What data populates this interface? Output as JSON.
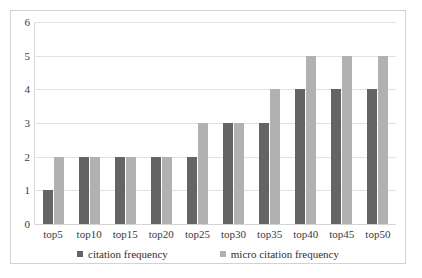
{
  "chart_data": {
    "type": "bar",
    "title": "",
    "xlabel": "",
    "ylabel": "",
    "categories": [
      "top5",
      "top10",
      "top15",
      "top20",
      "top25",
      "top30",
      "top35",
      "top40",
      "top45",
      "top50"
    ],
    "series": [
      {
        "name": "citation frequency",
        "color": "#646464",
        "values": [
          1,
          2,
          2,
          2,
          2,
          3,
          3,
          4,
          4,
          4
        ]
      },
      {
        "name": "micro citation frequency",
        "color": "#b1b1b1",
        "values": [
          2,
          2,
          2,
          2,
          3,
          3,
          4,
          5,
          5,
          5
        ]
      }
    ],
    "ylim": [
      0,
      6
    ],
    "yticks": [
      0,
      1,
      2,
      3,
      4,
      5,
      6
    ],
    "ytick_labels": [
      "0",
      "1",
      "2",
      "3",
      "4",
      "5",
      "6"
    ],
    "grid": true,
    "legend_position": "bottom",
    "frame_border_color": "#d2d2d2",
    "gridline_color": "#e2e2e2"
  }
}
